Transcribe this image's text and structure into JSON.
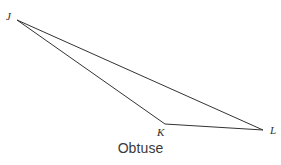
{
  "figure": {
    "caption": "Obtuse",
    "background_color": "#ffffff",
    "stroke_color": "#333333",
    "stroke_width": 1,
    "label_color": "#2e2e2e",
    "caption_color": "#3a3a3a",
    "width": 281,
    "height": 165
  },
  "triangle": {
    "name": "triangle-JKL",
    "classification": "Obtuse",
    "vertices": [
      {
        "id": "J",
        "label": "J",
        "x": 17,
        "y": 20
      },
      {
        "id": "K",
        "label": "K",
        "x": 165,
        "y": 124
      },
      {
        "id": "L",
        "label": "L",
        "x": 263,
        "y": 130
      }
    ],
    "edges": [
      {
        "id": "JK",
        "from": "J",
        "to": "K"
      },
      {
        "id": "KL",
        "from": "K",
        "to": "L"
      },
      {
        "id": "LJ",
        "from": "L",
        "to": "J"
      }
    ],
    "path": "M 17,20 L 165,124 L 263,130 Z"
  },
  "chart_data": {
    "type": "diagram",
    "title": "Obtuse",
    "shape": "triangle",
    "points": {
      "J": [
        17,
        20
      ],
      "K": [
        165,
        124
      ],
      "L": [
        263,
        130
      ]
    },
    "labels": [
      "J",
      "K",
      "L"
    ],
    "annotations": [
      "Obtuse"
    ]
  }
}
